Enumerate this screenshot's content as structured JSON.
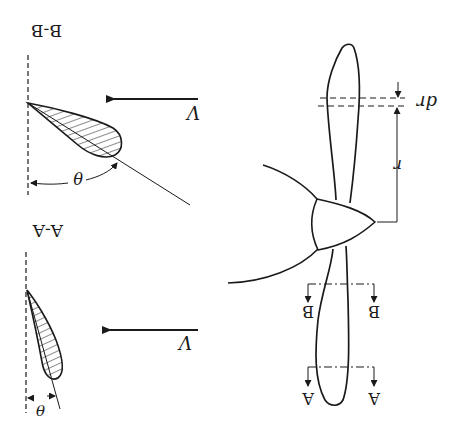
{
  "figure": {
    "orientation": "rotated-180",
    "colors": {
      "ink": "#1a1a1a",
      "background": "#ffffff"
    }
  },
  "labels": {
    "section_bb_title": "B-B",
    "section_aa_title": "A-A",
    "velocity_bb": "V",
    "velocity_aa": "V",
    "theta_bb": "θ",
    "theta_aa": "θ",
    "dr": "dr",
    "r": "r",
    "cut_b_left": "B",
    "cut_b_right": "B",
    "cut_a_left": "A",
    "cut_a_right": "A"
  },
  "components": {
    "propeller": [
      "hub",
      "upper-blade",
      "lower-blade",
      "spinner-arcs"
    ],
    "sections": [
      "B-B airfoil section",
      "A-A airfoil section"
    ],
    "dimensions": [
      "r radial distance",
      "dr blade element width"
    ]
  }
}
